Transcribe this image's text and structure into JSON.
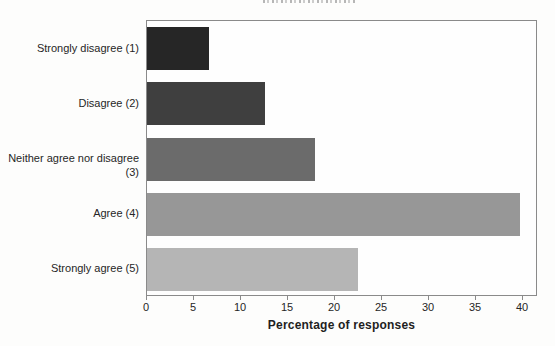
{
  "figure": {
    "title_clipped": true,
    "x_axis_title": "Percentage of responses"
  },
  "chart_data": {
    "type": "bar",
    "orientation": "horizontal",
    "title": "",
    "title_note": "title cropped off at top edge of screenshot; unreadable",
    "categories": [
      "Strongly disagree (1)",
      "Disagree (2)",
      "Neither agree nor disagree (3)",
      "Agree (4)",
      "Strongly agree (5)"
    ],
    "values": [
      6.6,
      12.5,
      17.9,
      39.7,
      22.4
    ],
    "bar_colors": [
      "#262626",
      "#3f3f3f",
      "#6b6b6b",
      "#979797",
      "#b5b5b5"
    ],
    "xlabel": "Percentage of responses",
    "ylabel": "",
    "x_ticks": [
      0,
      5,
      10,
      15,
      20,
      25,
      30,
      35,
      40
    ],
    "xlim": [
      0,
      41.6
    ],
    "grid": false,
    "legend": false,
    "axis_color": "#8a8a8a",
    "text_color": "#262626"
  }
}
